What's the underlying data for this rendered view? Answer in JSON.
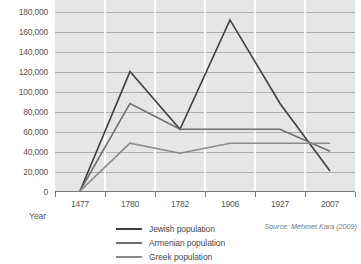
{
  "chart_data": {
    "type": "line",
    "title": "",
    "xlabel": "Year",
    "ylabel": "",
    "categories": [
      "1477",
      "1780",
      "1782",
      "1906",
      "1927",
      "2007"
    ],
    "ylim": [
      0,
      200000
    ],
    "yticks": [
      0,
      20000,
      40000,
      60000,
      80000,
      100000,
      120000,
      140000,
      160000,
      180000,
      200000
    ],
    "ytick_labels": [
      "0",
      "20,000",
      "40,000",
      "60,000",
      "80,000",
      "100,000",
      "120,000",
      "140,000",
      "160,000",
      "180,000",
      "200,000"
    ],
    "grid": true,
    "legend_position": "bottom-left",
    "series": [
      {
        "name": "Jewish population",
        "color": "#3f3f3f",
        "values": [
          0,
          120000,
          62000,
          172000,
          88000,
          20000
        ]
      },
      {
        "name": "Armenian population",
        "color": "#6e6e6e",
        "values": [
          0,
          88000,
          62000,
          62000,
          62000,
          40000
        ]
      },
      {
        "name": "Greek population",
        "color": "#8a8a8a",
        "values": [
          0,
          48000,
          38000,
          48000,
          48000,
          48000
        ]
      }
    ],
    "annotations": {
      "source": "Source: Mehmet Kara (2009)"
    }
  },
  "axis": {
    "x_title": "Year",
    "tick_labels": [
      "1477",
      "1780",
      "1782",
      "1906",
      "1927",
      "2007"
    ],
    "y_labels": [
      "200,000",
      "180,000",
      "160,000",
      "140,000",
      "120,000",
      "100,000",
      "80,000",
      "60,000",
      "40,000",
      "20,000",
      "0"
    ]
  },
  "legend": {
    "items": [
      {
        "label": "Jewish population",
        "color": "#3f3f3f"
      },
      {
        "label": "Armenian population",
        "color": "#6e6e6e"
      },
      {
        "label": "Greek population",
        "color": "#8a8a8a"
      }
    ]
  },
  "footer": {
    "source": "Source: Mehmet Kara (2009)"
  },
  "colors": {
    "plot_background": "#e6e6e6",
    "gridline": "#9a9a9a",
    "separator": "#ffffff",
    "axis": "#7a7a7a",
    "text": "#555555"
  }
}
